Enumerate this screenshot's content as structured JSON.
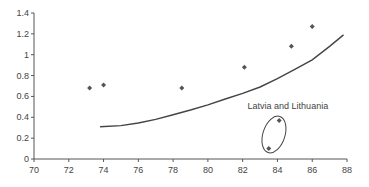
{
  "chart_data": {
    "type": "scatter",
    "title": "",
    "xlabel": "",
    "ylabel": "",
    "xlim": [
      70,
      88
    ],
    "ylim": [
      0,
      1.4
    ],
    "xticks": [
      70,
      72,
      74,
      76,
      78,
      80,
      82,
      84,
      86,
      88
    ],
    "yticks": [
      0,
      0.2,
      0.4,
      0.6,
      0.8,
      1,
      1.2,
      1.4
    ],
    "ytick_labels": [
      "0",
      "0.2",
      "0.4",
      "0.6",
      "0.8",
      "1",
      "1.2",
      "1.4"
    ],
    "grid": false,
    "series": [
      {
        "name": "points",
        "x": [
          73.2,
          74.0,
          78.5,
          82.1,
          84.8,
          86.0,
          84.1,
          83.5
        ],
        "y": [
          0.68,
          0.71,
          0.68,
          0.88,
          1.08,
          1.27,
          0.37,
          0.1
        ]
      },
      {
        "name": "trend",
        "type": "line",
        "x": [
          73.8,
          75,
          76,
          77,
          78,
          79,
          80,
          81,
          82,
          83,
          84,
          85,
          86,
          87,
          87.8
        ],
        "y": [
          0.31,
          0.32,
          0.345,
          0.38,
          0.425,
          0.47,
          0.52,
          0.575,
          0.63,
          0.69,
          0.77,
          0.86,
          0.95,
          1.08,
          1.19
        ]
      }
    ],
    "annotations": [
      {
        "text": "Latvia and Lithuania",
        "x": 84.6,
        "y": 0.5,
        "encircles": [
          [
            84.1,
            0.37
          ],
          [
            83.5,
            0.1
          ]
        ]
      }
    ]
  },
  "colors": {
    "axis": "#555555",
    "marker": "#555555",
    "line": "#444444"
  }
}
